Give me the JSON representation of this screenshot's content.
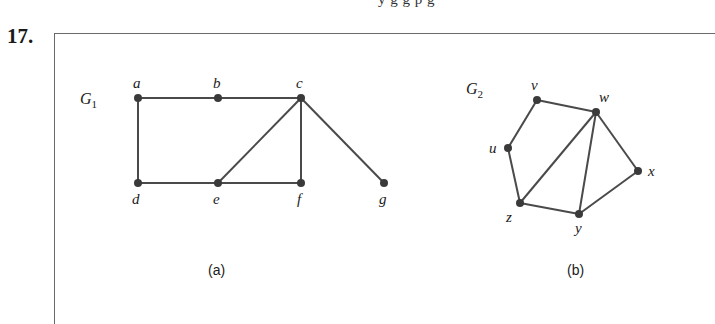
{
  "header": {
    "clipped_text": "y g   g p   g",
    "problem_number": "17."
  },
  "figure": {
    "graphs": [
      {
        "id": "G1",
        "label": "G",
        "label_subscript": "1",
        "caption": "(a)",
        "vertices": [
          {
            "name": "a",
            "x": 138,
            "y": 98
          },
          {
            "name": "b",
            "x": 218,
            "y": 98
          },
          {
            "name": "c",
            "x": 301,
            "y": 98
          },
          {
            "name": "d",
            "x": 138,
            "y": 183
          },
          {
            "name": "e",
            "x": 218,
            "y": 183
          },
          {
            "name": "f",
            "x": 301,
            "y": 183
          },
          {
            "name": "g",
            "x": 384,
            "y": 183
          }
        ],
        "edges": [
          [
            "a",
            "b"
          ],
          [
            "b",
            "c"
          ],
          [
            "a",
            "d"
          ],
          [
            "d",
            "e"
          ],
          [
            "e",
            "f"
          ],
          [
            "c",
            "f"
          ],
          [
            "c",
            "e"
          ],
          [
            "c",
            "g"
          ]
        ]
      },
      {
        "id": "G2",
        "label": "G",
        "label_subscript": "2",
        "caption": "(b)",
        "vertices": [
          {
            "name": "u",
            "x": 508,
            "y": 148
          },
          {
            "name": "v",
            "x": 537,
            "y": 100
          },
          {
            "name": "w",
            "x": 596,
            "y": 112
          },
          {
            "name": "x",
            "x": 638,
            "y": 171
          },
          {
            "name": "y",
            "x": 579,
            "y": 214
          },
          {
            "name": "z",
            "x": 520,
            "y": 203
          }
        ],
        "edges": [
          [
            "u",
            "v"
          ],
          [
            "v",
            "w"
          ],
          [
            "w",
            "x"
          ],
          [
            "x",
            "y"
          ],
          [
            "y",
            "z"
          ],
          [
            "z",
            "u"
          ],
          [
            "w",
            "z"
          ],
          [
            "w",
            "y"
          ]
        ]
      }
    ],
    "colors": {
      "edge": "#4a4a4a",
      "node": "#3a3a3a",
      "border": "#6a6a6a"
    }
  }
}
